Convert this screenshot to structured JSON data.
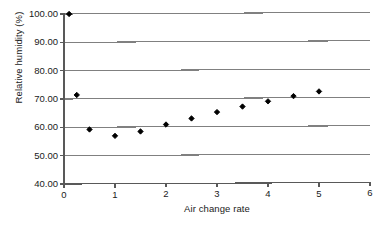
{
  "chart_data": {
    "type": "scatter",
    "title": "",
    "xlabel": "Air change rate",
    "ylabel": "Relative humidity (%)",
    "xlim": [
      0,
      6
    ],
    "ylim": [
      40.0,
      100.0
    ],
    "xticks": [
      "0",
      "1",
      "2",
      "3",
      "4",
      "5",
      "6"
    ],
    "xtick_values": [
      0,
      1,
      2,
      3,
      4,
      5,
      6
    ],
    "yticks": [
      "40.00",
      "50.00",
      "60.00",
      "70.00",
      "80.00",
      "90.00",
      "100.00"
    ],
    "ytick_values": [
      40,
      50,
      60,
      70,
      80,
      90,
      100
    ],
    "grid": "horizontal",
    "legend": "none",
    "marker": "diamond",
    "marker_color": "#000000",
    "grid_color": "#808080",
    "axis_color": "#595959",
    "series": [
      {
        "name": "Relative humidity",
        "x": [
          0.1,
          0.25,
          0.5,
          1.0,
          1.5,
          2.0,
          2.5,
          3.0,
          3.5,
          4.0,
          4.5,
          5.0
        ],
        "y": [
          100.0,
          71.4,
          59.2,
          56.9,
          58.4,
          60.8,
          62.9,
          65.1,
          67.0,
          68.8,
          70.6,
          72.2
        ]
      }
    ]
  }
}
